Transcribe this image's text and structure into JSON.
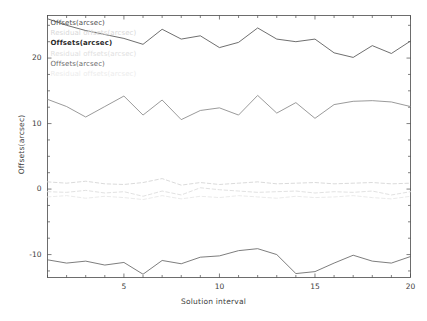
{
  "chart_data": {
    "type": "line",
    "title": "",
    "xlabel": "Solution interval",
    "ylabel": "Offsets(arcsec)",
    "xlim": [
      1,
      20
    ],
    "ylim": [
      -13.5,
      26.5
    ],
    "xticks": [
      5,
      10,
      15,
      20
    ],
    "yticks": [
      -10,
      0,
      10,
      20
    ],
    "grid": false,
    "legend_position": "upper left",
    "legend_entries": [
      {
        "label": "Offsets(arcsec)",
        "color": "#4c4c4c",
        "style": "solid"
      },
      {
        "label": "Residual offsets(arcsec)",
        "color": "#d8d8d8",
        "style": "dashed"
      },
      {
        "label": "Offsets(arcsec)",
        "color": "#2b2b2b",
        "style": "solid"
      },
      {
        "label": "Residual offsets(arcsec)",
        "color": "#e0e0e0",
        "style": "dashed"
      },
      {
        "label": "Offsets(arcsec)",
        "color": "#6a6a6a",
        "style": "solid"
      },
      {
        "label": "Residual offsets(arcsec)",
        "color": "#ececec",
        "style": "dashed"
      }
    ],
    "x": [
      1,
      2,
      3,
      4,
      5,
      6,
      7,
      8,
      9,
      10,
      11,
      12,
      13,
      14,
      15,
      16,
      17,
      18,
      19,
      20
    ],
    "series": [
      {
        "name": "Offsets(arcsec)",
        "color": "#555555",
        "style": "solid",
        "values": [
          26.0,
          25.0,
          24.2,
          23.6,
          23.0,
          22.1,
          24.4,
          22.9,
          23.4,
          21.6,
          22.4,
          24.6,
          22.9,
          22.5,
          22.9,
          20.8,
          20.1,
          21.9,
          20.7,
          22.6
        ]
      },
      {
        "name": "Offsets(arcsec)",
        "color": "#888888",
        "style": "solid",
        "values": [
          13.7,
          12.6,
          11.0,
          12.6,
          14.2,
          11.3,
          13.6,
          10.6,
          12.0,
          12.4,
          11.3,
          14.3,
          11.6,
          13.2,
          10.8,
          12.9,
          13.4,
          13.5,
          13.3,
          12.6
        ]
      },
      {
        "name": "Offsets(arcsec)",
        "color": "#666666",
        "style": "solid",
        "values": [
          -10.8,
          -11.3,
          -11.0,
          -11.6,
          -11.2,
          -13.0,
          -10.9,
          -11.4,
          -10.4,
          -10.2,
          -9.4,
          -9.1,
          -10.0,
          -12.9,
          -12.6,
          -11.3,
          -10.1,
          -11.0,
          -11.3,
          -10.3
        ]
      },
      {
        "name": "Residual offsets(arcsec)",
        "color": "#d6d6d6",
        "style": "dashed",
        "values": [
          1.1,
          0.9,
          1.2,
          0.8,
          0.7,
          1.0,
          1.6,
          0.6,
          1.0,
          0.7,
          0.9,
          1.1,
          0.8,
          0.9,
          1.0,
          0.8,
          0.9,
          1.0,
          0.8,
          0.9
        ]
      },
      {
        "name": "Residual offsets(arcsec)",
        "color": "#dedede",
        "style": "dashed",
        "values": [
          -0.4,
          -0.5,
          -0.2,
          -0.6,
          -0.4,
          -1.1,
          -0.3,
          -0.9,
          0.2,
          -0.1,
          -0.3,
          -0.5,
          -0.4,
          -0.3,
          -0.6,
          -0.4,
          -0.5,
          -0.3,
          -0.9,
          -0.4
        ]
      },
      {
        "name": "Residual offsets(arcsec)",
        "color": "#e8e8e8",
        "style": "dashed",
        "values": [
          -1.2,
          -1.0,
          -1.4,
          -1.1,
          -1.3,
          -1.6,
          -1.0,
          -1.5,
          -1.1,
          -1.3,
          -1.0,
          -1.2,
          -1.4,
          -1.1,
          -1.3,
          -1.2,
          -1.0,
          -1.3,
          -1.5,
          -1.1
        ]
      }
    ]
  }
}
